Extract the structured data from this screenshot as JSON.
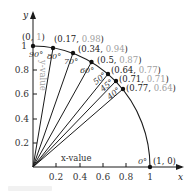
{
  "diagram": {
    "type": "unit-circle-quadrant",
    "axes": {
      "x_label": "x",
      "y_label": "y",
      "x_value_label": "x-value",
      "y_value_label": "y-value",
      "x_ticks": [
        "0.2",
        "0.4",
        "0.6",
        "0.8",
        "1"
      ],
      "y_ticks": [
        "0.2",
        "0.4",
        "0.6",
        "0.8",
        "1"
      ]
    },
    "points": [
      {
        "angle": "90°",
        "x": "0",
        "y": "1",
        "label_x": "(0, ",
        "label_y": "1",
        "label_close": ")",
        "cos": 0.0,
        "sin": 1.0
      },
      {
        "angle": "80°",
        "x": "0.17",
        "y": "0.98",
        "label_x": "(0.17, ",
        "label_y": "0.98",
        "label_close": ")",
        "cos": 0.17,
        "sin": 0.98
      },
      {
        "angle": "70°",
        "x": "0.34",
        "y": "0.94",
        "label_x": "(0.34, ",
        "label_y": "0.94",
        "label_close": ")",
        "cos": 0.34,
        "sin": 0.94
      },
      {
        "angle": "60°",
        "x": "0.5",
        "y": "0.87",
        "label_x": "(0.5, ",
        "label_y": "0.87",
        "label_close": ")",
        "cos": 0.5,
        "sin": 0.87
      },
      {
        "angle": "50°",
        "x": "0.64",
        "y": "0.77",
        "label_x": "(0.64, ",
        "label_y": "0.77",
        "label_close": ")",
        "cos": 0.64,
        "sin": 0.77
      },
      {
        "angle": "45°",
        "x": "0.71",
        "y": "0.71",
        "label_x": "(0.71, ",
        "label_y": "0.71",
        "label_close": ")",
        "cos": 0.71,
        "sin": 0.71
      },
      {
        "angle": "40°",
        "x": "0.77",
        "y": "0.64",
        "label_x": "(0.77, ",
        "label_y": "0.64",
        "label_close": ")",
        "cos": 0.77,
        "sin": 0.64
      },
      {
        "angle": "0°",
        "x": "1",
        "y": "0",
        "label_x": "(1, ",
        "label_y": "0",
        "label_close": ")",
        "cos": 1.0,
        "sin": 0.0
      }
    ],
    "colors": {
      "line": "#1a1a1a",
      "y_value_text": "#a0a0a0",
      "text": "#222222"
    }
  }
}
